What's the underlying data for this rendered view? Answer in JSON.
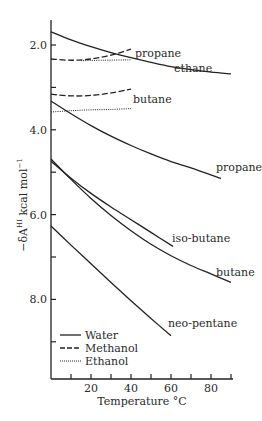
{
  "chart_data": {
    "type": "line",
    "title": "",
    "xlabel": "Temperature °C",
    "ylabel": "−δA^HI kcal mol^−1",
    "ylabel_parts": {
      "prefix": "−δA",
      "sup": "HI",
      "unit": " kcal mol",
      "unit_sup": "−1"
    },
    "xlim": [
      0,
      90
    ],
    "ylim": [
      9.88,
      1.41
    ],
    "y_inverted": true,
    "grid": false,
    "x_ticks": [
      10,
      20,
      30,
      40,
      50,
      60,
      70,
      80,
      90
    ],
    "x_tick_labels": [
      {
        "value": 20,
        "label": "20"
      },
      {
        "value": 40,
        "label": "40"
      },
      {
        "value": 60,
        "label": "60"
      },
      {
        "value": 80,
        "label": "80"
      }
    ],
    "y_ticks": [
      2,
      3,
      4,
      5,
      6,
      7,
      8,
      9
    ],
    "y_tick_labels": [
      {
        "value": 2,
        "label": "2.0"
      },
      {
        "value": 4,
        "label": "4.0"
      },
      {
        "value": 6,
        "label": "6.0"
      },
      {
        "value": 8,
        "label": "8.0"
      }
    ],
    "legend": {
      "position": "lower-left",
      "entries": [
        {
          "label": "Water",
          "style": "solid"
        },
        {
          "label": "Methanol",
          "style": "dashed"
        },
        {
          "label": "Ethanol",
          "style": "dotted"
        }
      ]
    },
    "series": [
      {
        "name": "ethane (water)",
        "solvent": "Water",
        "style": "solid",
        "label": "ethane",
        "label_pos": [
          174,
          72
        ],
        "x": [
          0,
          10,
          20,
          30,
          40,
          50,
          60,
          70,
          80,
          90
        ],
        "y": [
          1.69,
          1.88,
          2.04,
          2.18,
          2.3,
          2.41,
          2.51,
          2.58,
          2.64,
          2.68
        ]
      },
      {
        "name": "propane (methanol)",
        "solvent": "Methanol",
        "style": "dashed",
        "label": "propane",
        "label_pos": [
          135,
          57
        ],
        "x": [
          0,
          10,
          20,
          30,
          40
        ],
        "y": [
          2.33,
          2.36,
          2.33,
          2.24,
          2.1
        ]
      },
      {
        "name": "propane (ethanol)",
        "solvent": "Ethanol",
        "style": "dotted",
        "label": "",
        "x": [
          15,
          25,
          40
        ],
        "y": [
          2.37,
          2.36,
          2.35
        ]
      },
      {
        "name": "butane (methanol)",
        "solvent": "Methanol",
        "style": "dashed",
        "label": "butane",
        "label_pos": [
          133,
          103
        ],
        "x": [
          0,
          10,
          20,
          30,
          40
        ],
        "y": [
          3.16,
          3.2,
          3.19,
          3.13,
          3.04
        ]
      },
      {
        "name": "butane (ethanol)",
        "solvent": "Ethanol",
        "style": "dotted",
        "label": "",
        "x": [
          0,
          10,
          20,
          30,
          40
        ],
        "y": [
          3.58,
          3.55,
          3.53,
          3.52,
          3.5
        ]
      },
      {
        "name": "propane (water)",
        "solvent": "Water",
        "style": "solid",
        "label": "propane",
        "label_pos": [
          216,
          171
        ],
        "x": [
          0,
          10,
          20,
          30,
          40,
          50,
          60,
          70,
          85
        ],
        "y": [
          3.32,
          3.62,
          3.9,
          4.15,
          4.37,
          4.57,
          4.75,
          4.9,
          5.15
        ]
      },
      {
        "name": "iso-butane (water)",
        "solvent": "Water",
        "style": "solid",
        "label": "iso-butane",
        "label_pos": [
          172,
          242
        ],
        "x": [
          0,
          10,
          20,
          30,
          40,
          50,
          61
        ],
        "y": [
          4.74,
          5.14,
          5.5,
          5.82,
          6.12,
          6.42,
          6.75
        ]
      },
      {
        "name": "butane (water)",
        "solvent": "Water",
        "style": "solid",
        "label": "butane",
        "label_pos": [
          216,
          276
        ],
        "x": [
          0,
          10,
          20,
          30,
          40,
          50,
          60,
          70,
          80,
          90
        ],
        "y": [
          4.69,
          5.17,
          5.62,
          6.02,
          6.38,
          6.7,
          6.97,
          7.2,
          7.4,
          7.6
        ]
      },
      {
        "name": "neo-pentane (water)",
        "solvent": "Water",
        "style": "solid",
        "label": "neo-pentane",
        "label_pos": [
          168,
          327
        ],
        "x": [
          0,
          10,
          20,
          30,
          40,
          50,
          60
        ],
        "y": [
          6.27,
          6.72,
          7.16,
          7.6,
          8.03,
          8.45,
          8.86
        ]
      }
    ]
  }
}
